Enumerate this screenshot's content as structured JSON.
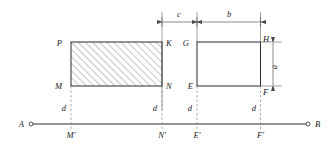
{
  "figure": {
    "type": "geometry-diagram",
    "background_color": "#ffffff",
    "line_color": "#2b2b2b",
    "guide_color": "#8a8a8a"
  },
  "baseline": {
    "label_left": "A",
    "label_right": "B",
    "endpoint_marker": "small-circle"
  },
  "vertices": {
    "p": "P",
    "k": "K",
    "m": "M",
    "n": "N",
    "g": "G",
    "h": "H",
    "e": "E",
    "f": "F"
  },
  "projections": {
    "m_prime": "M'",
    "n_prime": "N'",
    "e_prime": "E'",
    "f_prime": "F'"
  },
  "dimensions": {
    "c": "c",
    "b": "b",
    "a": "a",
    "d1": "d",
    "d2": "d",
    "d3": "d",
    "d4": "d"
  },
  "shapes": {
    "left_rectangle": {
      "name": "PKNM",
      "fill": "hatched",
      "hatch_angle_deg": 45
    },
    "right_rectangle": {
      "name": "GHFE",
      "fill": "none"
    }
  }
}
